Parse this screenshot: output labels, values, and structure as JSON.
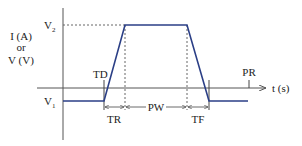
{
  "diagram": {
    "type": "pulse-waveform",
    "y_axis_label": {
      "line1": "I (A)",
      "line2": "or",
      "line3": "V (V)"
    },
    "x_axis_label": "t (s)",
    "levels": {
      "high": {
        "label": "V",
        "subscript": "2"
      },
      "low": {
        "label": "V",
        "subscript": "1"
      }
    },
    "segment_labels": {
      "delay": "TD",
      "rise": "TR",
      "width": "PW",
      "fall": "TF",
      "period": "PR"
    },
    "colors": {
      "waveform": "#2b3f86",
      "axes": "#555555",
      "dashed": "#666666",
      "text": "#222222"
    }
  }
}
